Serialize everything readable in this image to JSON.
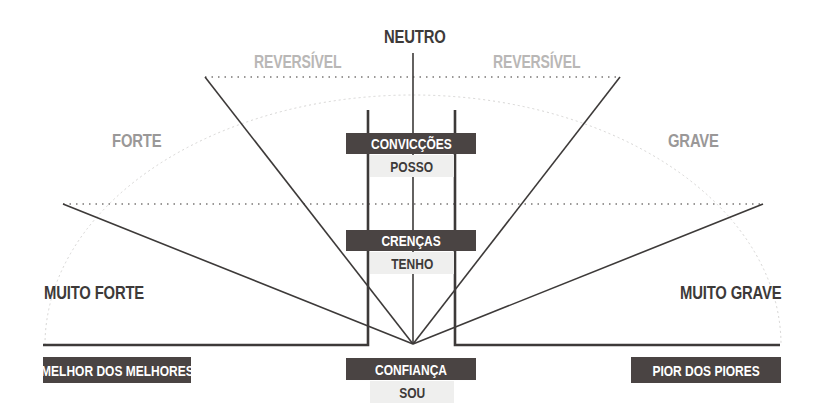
{
  "top_label": "NEUTRO",
  "reversible_labels": {
    "left": "REVERSÍVEL",
    "right": "REVERSÍVEL"
  },
  "side_labels": {
    "left_upper": "FORTE",
    "right_upper": "GRAVE",
    "left_lower": "MUITO FORTE",
    "right_lower": "MUITO GRAVE"
  },
  "center_levels": [
    {
      "title": "CONVICÇÕES",
      "sub": "POSSO"
    },
    {
      "title": "CRENÇAS",
      "sub": "TENHO"
    },
    {
      "title": "CONFIANÇA",
      "sub": "SOU"
    }
  ],
  "extremes": {
    "left": "MELHOR DOS MELHORES",
    "right": "PIOR DOS PIORES"
  },
  "colors": {
    "dark_box": "#4a4443",
    "light_box": "#efefee",
    "line": "#3d3a39",
    "grey_text": "#9a9898",
    "light_text": "#b9b7b6"
  }
}
